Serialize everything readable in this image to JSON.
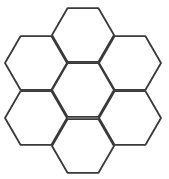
{
  "diagram": {
    "type": "hexagon-honeycomb",
    "shape": "flat-top hexagon",
    "count": 7,
    "stroke_color": "#3a3a3a",
    "stroke_width": 1.8,
    "fill_color": "#ffffff",
    "radius": 31,
    "cells": [
      {
        "id": "top",
        "cx": 83,
        "cy": 35
      },
      {
        "id": "left-top",
        "cx": 36,
        "cy": 63
      },
      {
        "id": "right-top",
        "cx": 130,
        "cy": 63
      },
      {
        "id": "center",
        "cx": 83,
        "cy": 90
      },
      {
        "id": "left-bottom",
        "cx": 36,
        "cy": 118
      },
      {
        "id": "right-bottom",
        "cx": 130,
        "cy": 118
      },
      {
        "id": "bottom",
        "cx": 83,
        "cy": 146
      }
    ]
  }
}
